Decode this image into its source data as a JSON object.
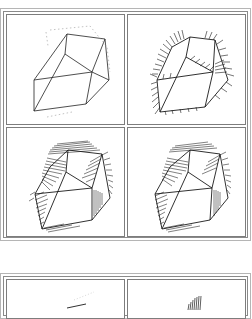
{
  "figure_top": {
    "label": "Four-panel progressive hatching rendering of a polyhedral solid",
    "panels": [
      {
        "id": "a",
        "description": "Wireframe polyhedron with dotted hidden outline"
      },
      {
        "id": "b",
        "description": "Polyhedron with sparse edge hatching"
      },
      {
        "id": "c",
        "description": "Polyhedron with dense silhouette hatching"
      },
      {
        "id": "d",
        "description": "Polyhedron with dense hatching variant"
      }
    ]
  },
  "figure_bottom": {
    "label": "Second figure, partially visible (cropped)",
    "panels": [
      {
        "id": "e",
        "description": "Partial stroke, cropped"
      },
      {
        "id": "f",
        "description": "Partial hatching strokes, cropped"
      }
    ]
  },
  "colors": {
    "ink": "#1a1a1a",
    "frame": "#7d7d7d",
    "paper": "#ffffff"
  }
}
